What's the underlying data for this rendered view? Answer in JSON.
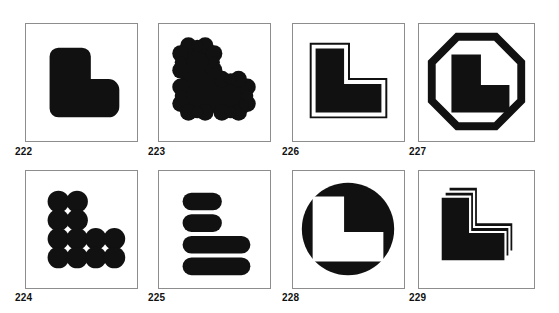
{
  "page": {
    "background_color": "#ffffff",
    "ink_color": "#111111",
    "panel_border_color": "#8d8d8d"
  },
  "panels": [
    {
      "id": "222",
      "caption": "222",
      "figure_name": "rounded-l-shape",
      "description": "Solid black L-shape with heavily rounded corners",
      "row": 1,
      "column": 1
    },
    {
      "id": "223",
      "caption": "223",
      "figure_name": "scalloped-puzzle-l-shape",
      "description": "Solid black L-shape with bumpy jigsaw-puzzle scalloped edges",
      "row": 1,
      "column": 2
    },
    {
      "id": "226",
      "caption": "226",
      "figure_name": "outlined-l-shape",
      "description": "Black L-shape surrounded by a white gap and a thin black contour line",
      "row": 1,
      "column": 3
    },
    {
      "id": "227",
      "caption": "227",
      "figure_name": "octagon-framed-l-shape",
      "description": "Black L-shape enclosed by a thick black octagon outline",
      "row": 1,
      "column": 4
    },
    {
      "id": "224",
      "caption": "224",
      "figure_name": "circle-grid-l-shape",
      "description": "L-shape built from a grid of overlapping black circles",
      "row": 2,
      "column": 1
    },
    {
      "id": "225",
      "caption": "225",
      "figure_name": "stacked-bars-l-shape",
      "description": "L-shape built from four horizontal rounded bars, two short above two long",
      "row": 2,
      "column": 2
    },
    {
      "id": "228",
      "caption": "228",
      "figure_name": "reversed-circle-l-shape",
      "description": "Filled black circle with a white L-shape reversed out of it",
      "row": 2,
      "column": 3
    },
    {
      "id": "229",
      "caption": "229",
      "figure_name": "layered-offset-l-shapes",
      "description": "Three black L-shapes stacked with a diagonal offset, giving a layered look",
      "row": 2,
      "column": 4
    }
  ],
  "layout": {
    "rows": 2,
    "columns": 4,
    "panel_geometry": [
      {
        "id": "222",
        "x": 25,
        "y": 23,
        "w": 113,
        "h": 119,
        "cx": 15,
        "cy": 146
      },
      {
        "id": "223",
        "x": 158,
        "y": 23,
        "w": 113,
        "h": 119,
        "cx": 148,
        "cy": 146
      },
      {
        "id": "226",
        "x": 292,
        "y": 23,
        "w": 113,
        "h": 119,
        "cx": 282,
        "cy": 146
      },
      {
        "id": "227",
        "x": 418,
        "y": 23,
        "w": 117,
        "h": 119,
        "cx": 409,
        "cy": 146
      },
      {
        "id": "224",
        "x": 25,
        "y": 170,
        "w": 113,
        "h": 119,
        "cx": 15,
        "cy": 292
      },
      {
        "id": "225",
        "x": 158,
        "y": 170,
        "w": 113,
        "h": 119,
        "cx": 148,
        "cy": 292
      },
      {
        "id": "228",
        "x": 292,
        "y": 170,
        "w": 113,
        "h": 119,
        "cx": 282,
        "cy": 292
      },
      {
        "id": "229",
        "x": 418,
        "y": 170,
        "w": 117,
        "h": 119,
        "cx": 409,
        "cy": 292
      }
    ]
  }
}
